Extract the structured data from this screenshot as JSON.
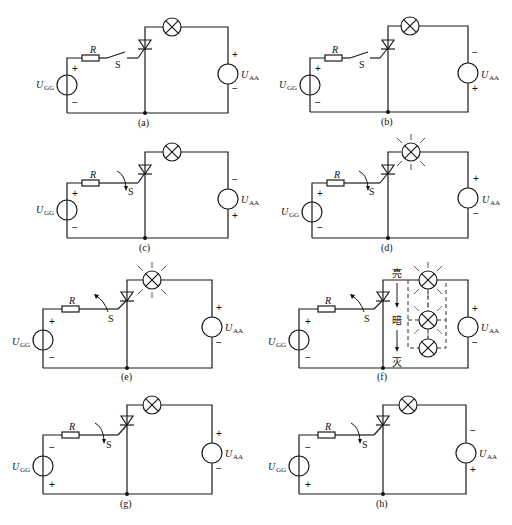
{
  "figure": {
    "labels": {
      "resistor": "R",
      "switch": "S",
      "gate_source": "U",
      "gate_source_sub": "GG",
      "anode_source": "U",
      "anode_source_sub": "AA",
      "plus": "+",
      "minus": "−"
    },
    "panels": [
      {
        "id": "a",
        "caption": "(a)",
        "ugg_top": "+",
        "ugg_bottom": "−",
        "uaa_top": "+",
        "uaa_bottom": "−",
        "switch": "open",
        "lamp": "off"
      },
      {
        "id": "b",
        "caption": "(b)",
        "ugg_top": "+",
        "ugg_bottom": "−",
        "uaa_top": "−",
        "uaa_bottom": "+",
        "switch": "open",
        "lamp": "off"
      },
      {
        "id": "c",
        "caption": "(c)",
        "ugg_top": "+",
        "ugg_bottom": "−",
        "uaa_top": "−",
        "uaa_bottom": "+",
        "switch": "closing",
        "lamp": "off"
      },
      {
        "id": "d",
        "caption": "(d)",
        "ugg_top": "+",
        "ugg_bottom": "−",
        "uaa_top": "+",
        "uaa_bottom": "−",
        "switch": "closing",
        "lamp": "lit"
      },
      {
        "id": "e",
        "caption": "(e)",
        "ugg_top": "+",
        "ugg_bottom": "−",
        "uaa_top": "+",
        "uaa_bottom": "−",
        "switch": "opening",
        "lamp": "lit"
      },
      {
        "id": "f",
        "caption": "(f)",
        "ugg_top": "+",
        "ugg_bottom": "−",
        "uaa_top": "+",
        "uaa_bottom": "−",
        "switch": "opening",
        "lamp": "dimming",
        "brightness_labels": {
          "bright": "亮",
          "dim": "暗",
          "off": "灭"
        }
      },
      {
        "id": "g",
        "caption": "(g)",
        "ugg_top": "−",
        "ugg_bottom": "+",
        "uaa_top": "+",
        "uaa_bottom": "−",
        "switch": "closing",
        "lamp": "off"
      },
      {
        "id": "h",
        "caption": "(h)",
        "ugg_top": "−",
        "ugg_bottom": "+",
        "uaa_top": "−",
        "uaa_bottom": "+",
        "switch": "closing",
        "lamp": "off"
      }
    ]
  }
}
